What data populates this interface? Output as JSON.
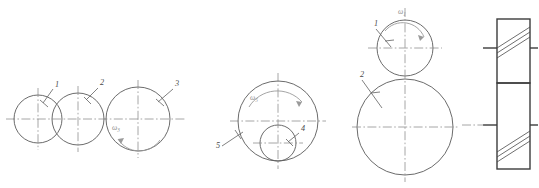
{
  "figure": {
    "background_color": "#ffffff",
    "line_color": "#5a5a5a",
    "center_line_color": "#8a8a8a",
    "label_color": "#4a4a4a",
    "omega_color": "#9a9a9a",
    "width": 539,
    "height": 188
  },
  "groups": [
    {
      "name": "group-a-three-tangent-circles",
      "circles": [
        {
          "label": "1",
          "cx": 38,
          "cy": 119,
          "r": 24
        },
        {
          "label": "2",
          "cx": 78,
          "cy": 119,
          "r": 26
        },
        {
          "label": "3",
          "cx": 138,
          "cy": 119,
          "r": 32
        }
      ],
      "labels": [
        {
          "text": "1",
          "x": 55,
          "y": 87
        },
        {
          "text": "2",
          "x": 100,
          "y": 85
        },
        {
          "text": "3",
          "x": 175,
          "y": 86
        }
      ],
      "omega": {
        "text": "ω",
        "sub": "3",
        "x": 112,
        "y": 130
      }
    },
    {
      "name": "group-b-internal-pair",
      "circles": [
        {
          "label": "5",
          "cx": 278,
          "cy": 121,
          "r": 40
        },
        {
          "label": "4",
          "cx": 278,
          "cy": 143,
          "r": 18
        }
      ],
      "labels": [
        {
          "text": "4",
          "x": 301,
          "y": 131
        },
        {
          "text": "5",
          "x": 216,
          "y": 148
        }
      ],
      "omega": {
        "text": "ω",
        "sub": "5",
        "x": 250,
        "y": 100
      }
    },
    {
      "name": "group-c-stacked-pair",
      "circles": [
        {
          "label": "1",
          "cx": 405,
          "cy": 48,
          "r": 28
        },
        {
          "label": "2",
          "cx": 405,
          "cy": 127,
          "r": 48
        }
      ],
      "labels": [
        {
          "text": "1",
          "x": 374,
          "y": 26
        },
        {
          "text": "2",
          "x": 360,
          "y": 77
        }
      ],
      "omega": {
        "text": "ω",
        "sub": "1",
        "x": 398,
        "y": 14
      }
    },
    {
      "name": "group-d-helical-side-view",
      "blocks": [
        {
          "x": 497,
          "y": 19,
          "width": 33,
          "height": 64,
          "hatch": "up-right"
        },
        {
          "x": 497,
          "y": 83,
          "width": 33,
          "height": 86,
          "hatch": "up-right"
        }
      ],
      "axis_marks": [
        {
          "y": 48
        },
        {
          "y": 125
        }
      ]
    }
  ]
}
